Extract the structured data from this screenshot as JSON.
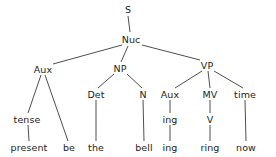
{
  "figure": {
    "kind": "syntax-tree-diagram",
    "width": 276,
    "height": 157,
    "background_color": "#ffffff",
    "line_color": "#3a3a3a",
    "text_color": "#1d1d1d"
  },
  "nodes": [
    {
      "id": "s",
      "label": "S",
      "x": 128,
      "y": 9
    },
    {
      "id": "nuc",
      "label": "Nuc",
      "x": 131,
      "y": 39
    },
    {
      "id": "aux-left",
      "label": "Aux",
      "x": 43,
      "y": 69
    },
    {
      "id": "np",
      "label": "NP",
      "x": 120,
      "y": 68
    },
    {
      "id": "vp",
      "label": "VP",
      "x": 207,
      "y": 65
    },
    {
      "id": "tense",
      "label": "tense",
      "x": 27,
      "y": 119
    },
    {
      "id": "present",
      "label": "present",
      "x": 29,
      "y": 147
    },
    {
      "id": "be",
      "label": "be",
      "x": 69,
      "y": 147
    },
    {
      "id": "det",
      "label": "Det",
      "x": 96,
      "y": 94
    },
    {
      "id": "the",
      "label": "the",
      "x": 96,
      "y": 147
    },
    {
      "id": "n",
      "label": "N",
      "x": 143,
      "y": 94
    },
    {
      "id": "bell",
      "label": "bell",
      "x": 144,
      "y": 147
    },
    {
      "id": "aux-right",
      "label": "Aux",
      "x": 170,
      "y": 94
    },
    {
      "id": "ing-mid",
      "label": "ing",
      "x": 170,
      "y": 119
    },
    {
      "id": "ing-leaf",
      "label": "ing",
      "x": 170,
      "y": 147
    },
    {
      "id": "mv",
      "label": "MV",
      "x": 210,
      "y": 94
    },
    {
      "id": "v",
      "label": "V",
      "x": 210,
      "y": 119
    },
    {
      "id": "ring",
      "label": "ring",
      "x": 210,
      "y": 147
    },
    {
      "id": "time",
      "label": "time",
      "x": 245,
      "y": 94
    },
    {
      "id": "now",
      "label": "now",
      "x": 246,
      "y": 147
    }
  ],
  "edges": [
    {
      "id": "edge-s-nuc",
      "from": "s",
      "to": "nuc",
      "x1": 128,
      "y1": 16,
      "x2": 130,
      "y2": 32
    },
    {
      "id": "edge-nuc-aux",
      "from": "nuc",
      "to": "aux-left",
      "x1": 122,
      "y1": 45,
      "x2": 53,
      "y2": 64
    },
    {
      "id": "edge-nuc-np",
      "from": "nuc",
      "to": "np",
      "x1": 128,
      "y1": 46,
      "x2": 121,
      "y2": 62
    },
    {
      "id": "edge-nuc-vp",
      "from": "nuc",
      "to": "vp",
      "x1": 142,
      "y1": 45,
      "x2": 200,
      "y2": 60
    },
    {
      "id": "edge-aux-tense",
      "from": "aux-left",
      "to": "tense",
      "x1": 41,
      "y1": 75,
      "x2": 28,
      "y2": 113
    },
    {
      "id": "edge-aux-be",
      "from": "aux-left",
      "to": "be",
      "x1": 45,
      "y1": 75,
      "x2": 68,
      "y2": 141
    },
    {
      "id": "edge-tense-present",
      "from": "tense",
      "to": "present",
      "x1": 28,
      "y1": 125,
      "x2": 29,
      "y2": 141
    },
    {
      "id": "edge-np-det",
      "from": "np",
      "to": "det",
      "x1": 114,
      "y1": 74,
      "x2": 98,
      "y2": 88
    },
    {
      "id": "edge-np-n",
      "from": "np",
      "to": "n",
      "x1": 127,
      "y1": 74,
      "x2": 142,
      "y2": 88
    },
    {
      "id": "edge-det-the",
      "from": "det",
      "to": "the",
      "x1": 96,
      "y1": 100,
      "x2": 96,
      "y2": 141
    },
    {
      "id": "edge-n-bell",
      "from": "n",
      "to": "bell",
      "x1": 143,
      "y1": 100,
      "x2": 144,
      "y2": 141
    },
    {
      "id": "edge-vp-auxr",
      "from": "vp",
      "to": "aux-right",
      "x1": 202,
      "y1": 71,
      "x2": 175,
      "y2": 88
    },
    {
      "id": "edge-vp-mv",
      "from": "vp",
      "to": "mv",
      "x1": 208,
      "y1": 71,
      "x2": 210,
      "y2": 88
    },
    {
      "id": "edge-vp-time",
      "from": "vp",
      "to": "time",
      "x1": 214,
      "y1": 71,
      "x2": 243,
      "y2": 88
    },
    {
      "id": "edge-auxr-ingmid",
      "from": "aux-right",
      "to": "ing-mid",
      "x1": 170,
      "y1": 100,
      "x2": 170,
      "y2": 113
    },
    {
      "id": "edge-ingmid-ingleaf",
      "from": "ing-mid",
      "to": "ing-leaf",
      "x1": 170,
      "y1": 125,
      "x2": 170,
      "y2": 141
    },
    {
      "id": "edge-mv-v",
      "from": "mv",
      "to": "v",
      "x1": 210,
      "y1": 100,
      "x2": 210,
      "y2": 113
    },
    {
      "id": "edge-v-ring",
      "from": "v",
      "to": "ring",
      "x1": 210,
      "y1": 125,
      "x2": 210,
      "y2": 141
    },
    {
      "id": "edge-time-now",
      "from": "time",
      "to": "now",
      "x1": 245,
      "y1": 100,
      "x2": 246,
      "y2": 141
    }
  ]
}
